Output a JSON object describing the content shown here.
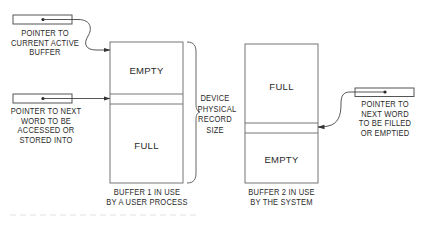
{
  "diagram": {
    "pointers": [
      {
        "id": "current-active-buffer",
        "label": "POINTER TO\nCURRENT ACTIVE\nBUFFER"
      },
      {
        "id": "next-word-accessed",
        "label": "POINTER TO NEXT\nWORD TO BE\nACCESSED OR\nSTORED INTO"
      },
      {
        "id": "next-word-filled",
        "label": "POINTER TO\nNEXT WORD\nTO BE FILLED\nOR EMPTIED"
      }
    ],
    "buffers": [
      {
        "id": "buffer-1",
        "top_region": "EMPTY",
        "bottom_region": "FULL",
        "caption": "BUFFER 1 IN USE\nBY A USER PROCESS"
      },
      {
        "id": "buffer-2",
        "top_region": "FULL",
        "bottom_region": "EMPTY",
        "caption": "BUFFER 2 IN USE\nBY THE SYSTEM"
      }
    ],
    "brace_label": "DEVICE\nPHYSICAL\nRECORD\nSIZE",
    "line_color": "#555555",
    "text_color": "#2a2a2a"
  }
}
